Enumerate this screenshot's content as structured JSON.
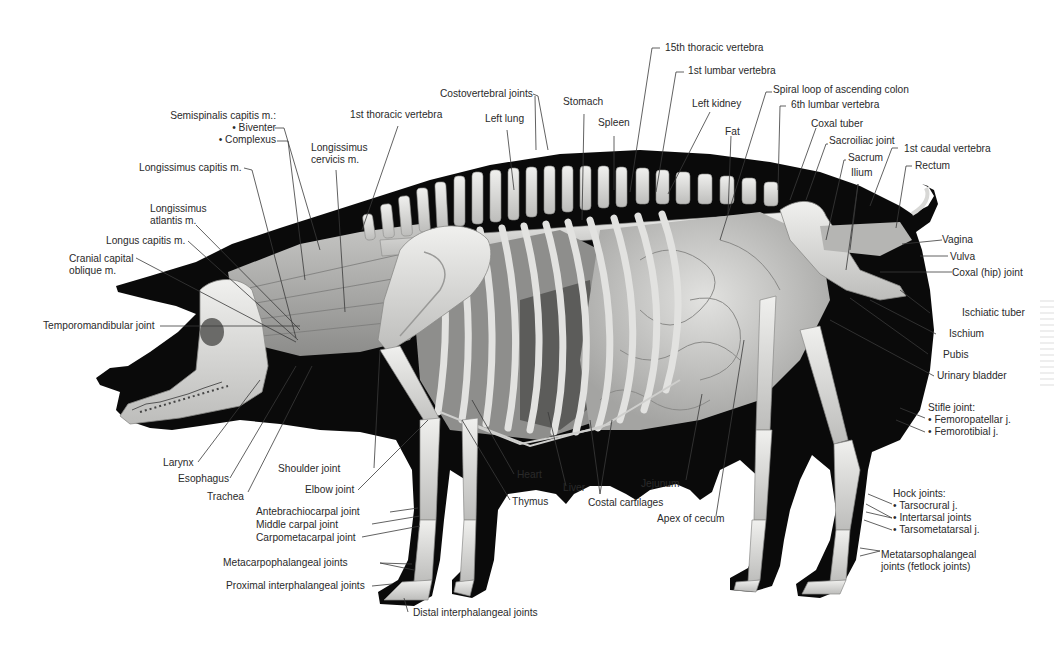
{
  "figure": {
    "colors": {
      "silhouette": "#0a0a0a",
      "bone": "#e4e4e2",
      "bone_shadow": "#b8b8b6",
      "muscle": "#a9a9a7",
      "viscera": "#c9c9c7",
      "viscera_dark": "#6e6e6c",
      "leader_line": "#3a3a3a",
      "label_text": "#2a2a2a",
      "background": "#ffffff"
    }
  },
  "labels": {
    "semispinalis": {
      "title": "Semispinalis capitis m.:",
      "items": [
        "• Biventer",
        "• Complexus"
      ]
    },
    "first_thoracic_vertebra": "1st thoracic vertebra",
    "longissimus_cervicis": [
      "Longissimus",
      "cervicis m."
    ],
    "longissimus_capitis": "Longissimus capitis m.",
    "longissimus_atlantis": [
      "Longissimus",
      "atlantis m."
    ],
    "longus_capitis": "Longus capitis m.",
    "cranial_capital_oblique": [
      "Cranial capital",
      "oblique m."
    ],
    "temporomandibular_joint": "Temporomandibular joint",
    "costovertebral_joints": "Costovertebral joints",
    "left_lung": "Left lung",
    "stomach": "Stomach",
    "spleen": "Spleen",
    "fifteenth_thoracic_vertebra": "15th thoracic vertebra",
    "first_lumbar_vertebra": "1st lumbar vertebra",
    "left_kidney": "Left kidney",
    "fat": "Fat",
    "spiral_loop_colon": "Spiral loop of ascending colon",
    "sixth_lumbar_vertebra": "6th lumbar vertebra",
    "coxal_tuber": "Coxal tuber",
    "sacroiliac_joint": "Sacroiliac joint",
    "sacrum": "Sacrum",
    "first_caudal_vertebra": "1st caudal vertebra",
    "ilium": "Ilium",
    "rectum": "Rectum",
    "vagina": "Vagina",
    "vulva": "Vulva",
    "coxal_hip_joint": "Coxal (hip) joint",
    "ischiatic_tuber": "Ischiatic tuber",
    "ischium": "Ischium",
    "pubis": "Pubis",
    "urinary_bladder": "Urinary bladder",
    "stifle_joint": {
      "title": "Stifle joint:",
      "items": [
        "• Femoropatellar j.",
        "• Femorotibial j."
      ]
    },
    "hock_joints": {
      "title": "Hock joints:",
      "items": [
        "• Tarsocrural j.",
        "• Intertarsal joints",
        "• Tarsometatarsal j."
      ]
    },
    "metatarsophalangeal": [
      "Metatarsophalangeal",
      "joints (fetlock joints)"
    ],
    "larynx": "Larynx",
    "esophagus": "Esophagus",
    "trachea": "Trachea",
    "shoulder_joint": "Shoulder joint",
    "elbow_joint": "Elbow joint",
    "heart": "Heart",
    "thymus": "Thymus",
    "liver": "Liver",
    "costal_cartilages": "Costal cartilages",
    "jejunum": "Jejunum",
    "apex_of_cecum": "Apex of cecum",
    "antebrachiocarpal_joint": "Antebrachiocarpal joint",
    "middle_carpal_joint": "Middle carpal joint",
    "carpometacarpal_joint": "Carpometacarpal joint",
    "metacarpophalangeal_joints": "Metacarpophalangeal joints",
    "proximal_interphalangeal_joints": "Proximal interphalangeal joints",
    "distal_interphalangeal_joints": "Distal interphalangeal joints"
  }
}
